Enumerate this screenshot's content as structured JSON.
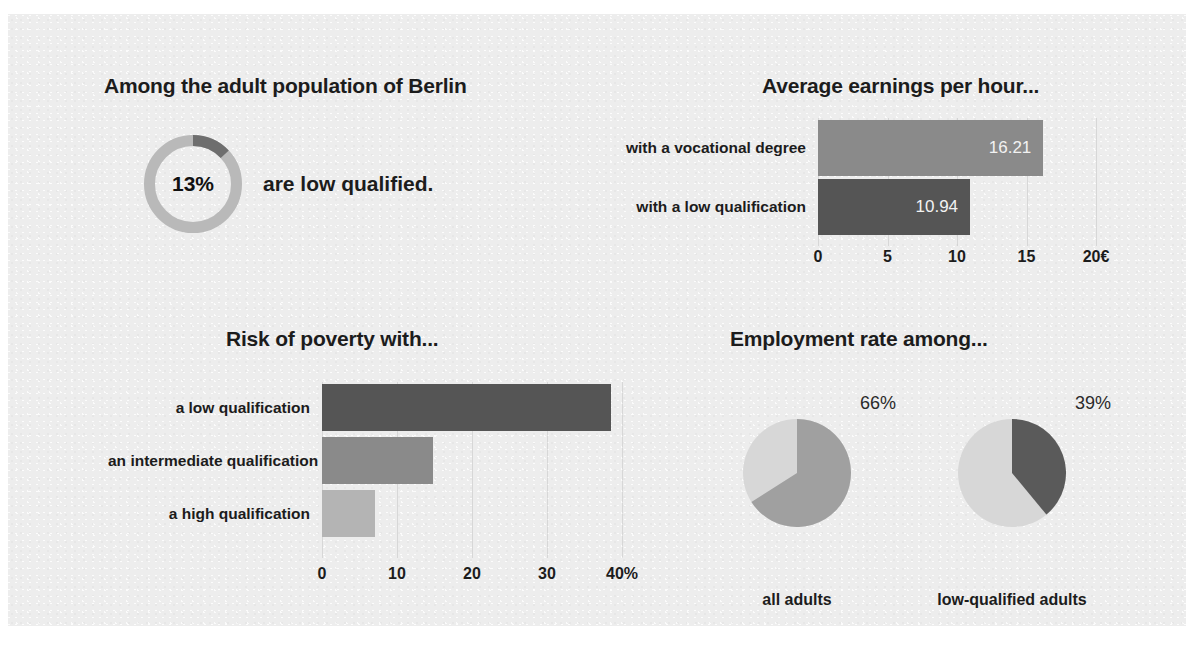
{
  "colors": {
    "background": "#ededed",
    "page": "#ffffff",
    "dark": "#555555",
    "medium": "#8a8a8a",
    "light": "#b4b4b4",
    "pie_light": "#d7d7d7",
    "donut_track": "#b9b9b9",
    "donut_segment": "#6e6e6e",
    "text": "#1c1c1c",
    "value_text": "#f2f2f2"
  },
  "donut_panel": {
    "title": "Among the adult population of Berlin",
    "center_value": "13%",
    "sentence": "are low qualified."
  },
  "earnings_panel": {
    "title": "Average earnings per hour..."
  },
  "poverty_panel": {
    "title": "Risk of poverty with..."
  },
  "employment_panel": {
    "title": "Employment rate among...",
    "pies": [
      {
        "caption": "all adults",
        "pct_label": "66%"
      },
      {
        "caption": "low-qualified adults",
        "pct_label": "39%"
      }
    ]
  },
  "chart_data": [
    {
      "type": "pie",
      "name": "low-qualified-share-donut",
      "title": "Among the adult population of Berlin",
      "annotation": "13% are low qualified.",
      "labels": [
        "low qualified",
        "not low qualified"
      ],
      "values": [
        13,
        87
      ],
      "unit": "%",
      "center_label": "13%",
      "donut": true,
      "colors": [
        "#6e6e6e",
        "#b9b9b9"
      ],
      "start_angle_deg": 0,
      "legend": "none"
    },
    {
      "type": "bar",
      "name": "average-earnings-per-hour",
      "orientation": "horizontal",
      "title": "Average earnings per hour...",
      "categories": [
        "with a vocational degree",
        "with a low qualification"
      ],
      "values": [
        16.21,
        10.94
      ],
      "data_labels": [
        "16.21",
        "10.94"
      ],
      "colors": [
        "#8a8a8a",
        "#555555"
      ],
      "xlabel": "",
      "ylabel": "",
      "xlim": [
        0,
        20
      ],
      "xticks": [
        0,
        5,
        10,
        15,
        20
      ],
      "xtick_labels": [
        "0",
        "5",
        "10",
        "15",
        "20€"
      ],
      "unit": "€",
      "grid": false,
      "legend": "none"
    },
    {
      "type": "bar",
      "name": "risk-of-poverty",
      "orientation": "horizontal",
      "title": "Risk of poverty with...",
      "categories": [
        "a low qualification",
        "an intermediate qualification",
        "a high qualification"
      ],
      "values": [
        38.5,
        14.8,
        7.0
      ],
      "colors": [
        "#555555",
        "#8a8a8a",
        "#b4b4b4"
      ],
      "xlabel": "",
      "ylabel": "",
      "xlim": [
        0,
        40
      ],
      "xticks": [
        0,
        10,
        20,
        30,
        40
      ],
      "xtick_labels": [
        "0",
        "10",
        "20",
        "30",
        "40%"
      ],
      "unit": "%",
      "grid": false,
      "legend": "none"
    },
    {
      "type": "pie",
      "name": "employment-rate-all-adults",
      "title": "Employment rate among...",
      "subtitle": "all adults",
      "labels": [
        "employed",
        "not employed"
      ],
      "values": [
        66,
        34
      ],
      "data_labels": [
        "66%"
      ],
      "unit": "%",
      "colors": [
        "#a0a0a0",
        "#d7d7d7"
      ],
      "start_angle_deg": 0,
      "legend": "none"
    },
    {
      "type": "pie",
      "name": "employment-rate-low-qualified-adults",
      "title": "Employment rate among...",
      "subtitle": "low-qualified adults",
      "labels": [
        "employed",
        "not employed"
      ],
      "values": [
        39,
        61
      ],
      "data_labels": [
        "39%"
      ],
      "unit": "%",
      "colors": [
        "#5a5a5a",
        "#d7d7d7"
      ],
      "start_angle_deg": 0,
      "legend": "none"
    }
  ]
}
